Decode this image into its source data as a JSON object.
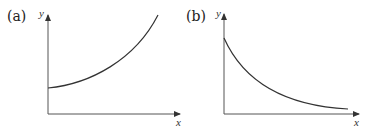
{
  "figure": {
    "panels": [
      {
        "label": "(a)",
        "x_axis_label": "x",
        "y_axis_label": "y",
        "curve_description": "increasing, concave up (exponential growth) starting from positive y-intercept"
      },
      {
        "label": "(b)",
        "x_axis_label": "x",
        "y_axis_label": "y",
        "curve_description": "decreasing, concave up (exponential decay) approaching x-axis"
      }
    ]
  },
  "colors": {
    "axis": "#555555",
    "curve": "#333333",
    "text": "#222222"
  }
}
